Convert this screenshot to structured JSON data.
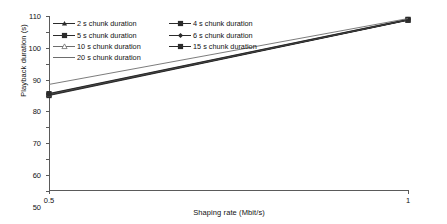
{
  "chart_data": {
    "type": "line",
    "title": "",
    "xlabel": "Shaping rate (Mbit/s)",
    "ylabel": "Playback duration (s)",
    "x": [
      0.5,
      1
    ],
    "xlim": [
      0.5,
      1
    ],
    "ylim": [
      0,
      110
    ],
    "xticks": [
      "0.5",
      "1"
    ],
    "yticks": [
      "0",
      "10",
      "20",
      "30",
      "40",
      "50",
      "60",
      "70",
      "80",
      "90",
      "100",
      "110"
    ],
    "grid": false,
    "legend_position": "upper-left-inside",
    "series": [
      {
        "name": "2 s chunk duration",
        "marker": "triangle-up-filled",
        "values": [
          60.5,
          107.5
        ]
      },
      {
        "name": "4 s chunk duration",
        "marker": "square-filled",
        "values": [
          60.5,
          107.5
        ]
      },
      {
        "name": "5 s chunk duration",
        "marker": "square-filled",
        "values": [
          60.0,
          107.3
        ]
      },
      {
        "name": "6 s chunk duration",
        "marker": "diamond-filled",
        "values": [
          60.8,
          107.6
        ]
      },
      {
        "name": "10 s chunk duration",
        "marker": "triangle-up-open",
        "values": [
          61.0,
          107.8
        ]
      },
      {
        "name": "15 s chunk duration",
        "marker": "square-filled",
        "values": [
          61.2,
          107.9
        ]
      },
      {
        "name": "20 s chunk duration",
        "marker": "line-only",
        "values": [
          67.0,
          108.4
        ]
      }
    ]
  },
  "axes": {
    "ylabel": "Playback duration (s)",
    "xlabel": "Shaping rate (Mbit/s)",
    "yticks": [
      "110",
      "100",
      "90",
      "80",
      "70",
      "60",
      "50",
      "40",
      "30",
      "20",
      "10",
      "0"
    ],
    "xticks": [
      "0.5",
      "1"
    ]
  },
  "legend": {
    "entries": [
      {
        "label": "2 s chunk duration"
      },
      {
        "label": "4 s chunk duration"
      },
      {
        "label": "5 s chunk duration"
      },
      {
        "label": "6 s chunk duration"
      },
      {
        "label": "10 s chunk duration"
      },
      {
        "label": "15 s chunk duration"
      },
      {
        "label": "20 s chunk duration"
      }
    ]
  },
  "colors": {
    "line": "#2b2b2b",
    "light_line": "#6d6d6d",
    "axis": "#5a5a5a",
    "text": "#111111",
    "background": "#ffffff"
  }
}
